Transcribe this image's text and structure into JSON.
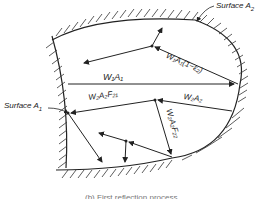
{
  "diagram": {
    "labels": {
      "surface_a2": "Surface A",
      "surface_a2_sub": "2",
      "surface_a1": "Surface A",
      "surface_a1_sub": "1",
      "w1a1_reflect": "W₁A₁(1−ε₂)",
      "w1a1": "W₁A₁",
      "w2a2f21": "W₂A₂F₂₁",
      "w2a2": "W₂A₂",
      "w2a2f22": "W₂A₂F₂₂"
    },
    "caption": "(b) First reflection process"
  },
  "colors": {
    "line": "#222222",
    "hatch": "#333333",
    "background": "#ffffff"
  }
}
